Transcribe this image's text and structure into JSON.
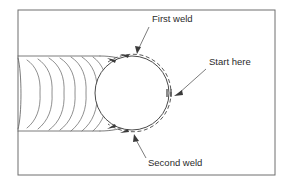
{
  "diagram": {
    "background_color": "#ffffff",
    "line_color": "#5a5a5a",
    "frame": {
      "x": 18,
      "y": 10,
      "width": 257,
      "height": 165,
      "stroke_color": "#6e6e6e"
    },
    "pipe": {
      "name": "welded-pipe-body",
      "bead_ripple_count": 7,
      "top_edge_y": 56,
      "bottom_edge_y": 131,
      "left_edge_x": 18
    },
    "pipe_end": {
      "name": "pipe-end-circle",
      "center_x": 132,
      "center_y": 93,
      "radius": 37
    },
    "weld_path": {
      "name": "dashed-weld-path",
      "style": "dashed",
      "offset": 4,
      "direction": "counterclockwise-from-start"
    },
    "start_marker": {
      "x": 169,
      "y": 93
    },
    "labels": [
      {
        "id": "first-weld",
        "text": "First weld",
        "text_x": 152,
        "text_y": 22,
        "leader_from_x": 149,
        "leader_from_y": 27,
        "leader_to_x": 138,
        "leader_to_y": 53
      },
      {
        "id": "start-here",
        "text": "Start here",
        "text_x": 209,
        "text_y": 65,
        "leader_from_x": 206,
        "leader_from_y": 69,
        "leader_to_x": 175,
        "leader_to_y": 95
      },
      {
        "id": "second-weld",
        "text": "Second weld",
        "text_x": 148,
        "text_y": 166,
        "leader_from_x": 146,
        "leader_from_y": 158,
        "leader_to_x": 134,
        "leader_to_y": 135
      }
    ],
    "arrowheads": [
      {
        "id": "first-weld-direction-arrow",
        "x": 111,
        "y": 59,
        "angle": 200
      },
      {
        "id": "first-weld-direction-arrow-2",
        "x": 124,
        "y": 55,
        "angle": 196
      },
      {
        "id": "second-weld-direction-arrow",
        "x": 112,
        "y": 128,
        "angle": 160
      },
      {
        "id": "second-weld-direction-arrow-2",
        "x": 125,
        "y": 132,
        "angle": 166
      }
    ]
  }
}
